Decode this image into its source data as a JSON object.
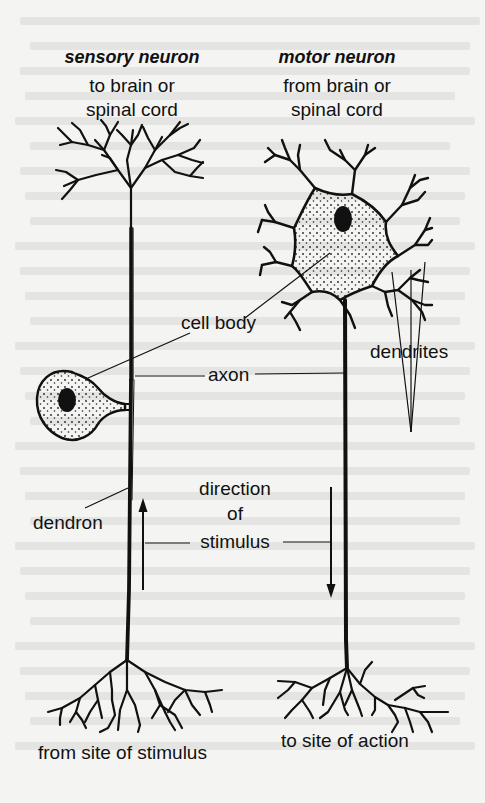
{
  "diagram": {
    "titles": {
      "sensory": "sensory neuron",
      "motor": "motor neuron"
    },
    "sensory": {
      "top_line1": "to brain or",
      "top_line2": "spinal cord",
      "bottom": "from site of stimulus"
    },
    "motor": {
      "top_line1": "from brain or",
      "top_line2": "spinal cord",
      "bottom": "to site of action"
    },
    "labels": {
      "cell_body": "cell body",
      "axon": "axon",
      "dendrites": "dendrites",
      "dendron": "dendron",
      "direction_line1": "direction",
      "direction_line2": "of",
      "direction_line3": "stimulus"
    },
    "colors": {
      "ink": "#111111",
      "paper": "#f4f4f2"
    }
  }
}
